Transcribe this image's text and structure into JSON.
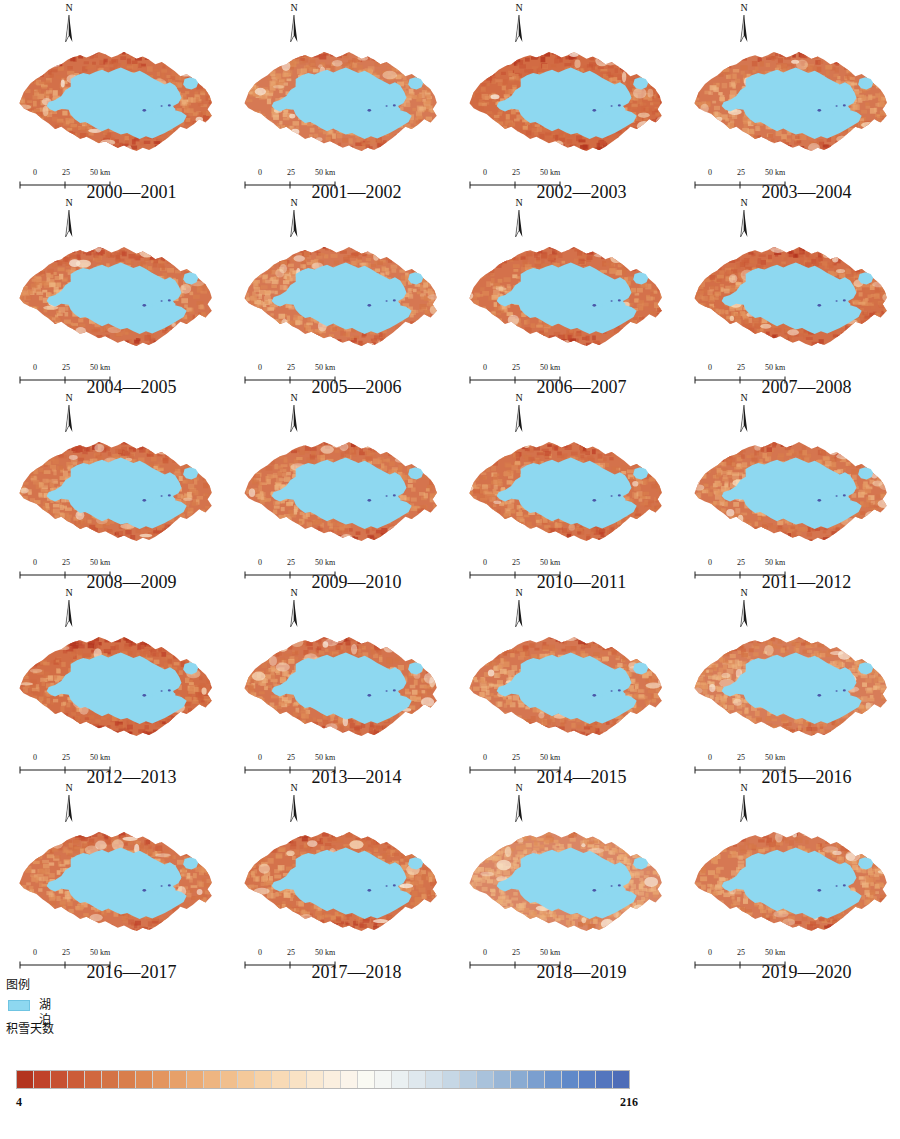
{
  "figure": {
    "type": "map-grid",
    "rows": 5,
    "columns": 4
  },
  "panels": [
    {
      "year_label": "2000—2001",
      "north_letter": "N",
      "scale": {
        "t0": "0",
        "t1": "25",
        "t2": "50 km"
      },
      "tone": 0.0
    },
    {
      "year_label": "2001—2002",
      "north_letter": "N",
      "scale": {
        "t0": "0",
        "t1": "25",
        "t2": "50 km"
      },
      "tone": 0.12
    },
    {
      "year_label": "2002—2003",
      "north_letter": "N",
      "scale": {
        "t0": "0",
        "t1": "25",
        "t2": "50 km"
      },
      "tone": -0.06
    },
    {
      "year_label": "2003—2004",
      "north_letter": "N",
      "scale": {
        "t0": "0",
        "t1": "25",
        "t2": "50 km"
      },
      "tone": 0.08
    },
    {
      "year_label": "2004—2005",
      "north_letter": "N",
      "scale": {
        "t0": "0",
        "t1": "25",
        "t2": "50 km"
      },
      "tone": 0.05
    },
    {
      "year_label": "2005—2006",
      "north_letter": "N",
      "scale": {
        "t0": "0",
        "t1": "25",
        "t2": "50 km"
      },
      "tone": 0.1
    },
    {
      "year_label": "2006—2007",
      "north_letter": "N",
      "scale": {
        "t0": "0",
        "t1": "25",
        "t2": "50 km"
      },
      "tone": 0.02
    },
    {
      "year_label": "2007—2008",
      "north_letter": "N",
      "scale": {
        "t0": "0",
        "t1": "25",
        "t2": "50 km"
      },
      "tone": -0.02
    },
    {
      "year_label": "2008—2009",
      "north_letter": "N",
      "scale": {
        "t0": "0",
        "t1": "25",
        "t2": "50 km"
      },
      "tone": 0.04
    },
    {
      "year_label": "2009—2010",
      "north_letter": "N",
      "scale": {
        "t0": "0",
        "t1": "25",
        "t2": "50 km"
      },
      "tone": 0.06
    },
    {
      "year_label": "2010—2011",
      "north_letter": "N",
      "scale": {
        "t0": "0",
        "t1": "25",
        "t2": "50 km"
      },
      "tone": 0.03
    },
    {
      "year_label": "2011—2012",
      "north_letter": "N",
      "scale": {
        "t0": "0",
        "t1": "25",
        "t2": "50 km"
      },
      "tone": 0.07
    },
    {
      "year_label": "2012—2013",
      "north_letter": "N",
      "scale": {
        "t0": "0",
        "t1": "25",
        "t2": "50 km"
      },
      "tone": -0.04
    },
    {
      "year_label": "2013—2014",
      "north_letter": "N",
      "scale": {
        "t0": "0",
        "t1": "25",
        "t2": "50 km"
      },
      "tone": 0.05
    },
    {
      "year_label": "2014—2015",
      "north_letter": "N",
      "scale": {
        "t0": "0",
        "t1": "25",
        "t2": "50 km"
      },
      "tone": 0.09
    },
    {
      "year_label": "2015—2016",
      "north_letter": "N",
      "scale": {
        "t0": "0",
        "t1": "25",
        "t2": "50 km"
      },
      "tone": 0.16
    },
    {
      "year_label": "2016—2017",
      "north_letter": "N",
      "scale": {
        "t0": "0",
        "t1": "25",
        "t2": "50 km"
      },
      "tone": 0.06
    },
    {
      "year_label": "2017—2018",
      "north_letter": "N",
      "scale": {
        "t0": "0",
        "t1": "25",
        "t2": "50 km"
      },
      "tone": 0.03
    },
    {
      "year_label": "2018—2019",
      "north_letter": "N",
      "scale": {
        "t0": "0",
        "t1": "25",
        "t2": "50 km"
      },
      "tone": 0.3
    },
    {
      "year_label": "2019—2020",
      "north_letter": "N",
      "scale": {
        "t0": "0",
        "t1": "25",
        "t2": "50 km"
      },
      "tone": 0.11
    }
  ],
  "legend": {
    "title": "图例",
    "lake_label": "湖泊",
    "lake_color": "#8ed8f0",
    "snow_title": "积雪天数",
    "colorbar_min": "4",
    "colorbar_max": "216",
    "colorbar_colors": [
      "#b3341f",
      "#c0422a",
      "#c75132",
      "#cc5c38",
      "#d1683f",
      "#d47345",
      "#d97e4c",
      "#de8a55",
      "#e3955f",
      "#e7a069",
      "#ebab75",
      "#eeb581",
      "#f1bf8d",
      "#f4c99a",
      "#f6d2a8",
      "#f8dab6",
      "#f9e2c4",
      "#fae9d2",
      "#fbefdf",
      "#fbf4ea",
      "#fafaf3",
      "#f4f6f4",
      "#eaf0f2",
      "#dfe8ee",
      "#d3e0ea",
      "#c6d7e5",
      "#b8cde0",
      "#a9c2db",
      "#99b6d6",
      "#8aabd2",
      "#7b9fcf",
      "#6d94cc",
      "#6089c9",
      "#5a7fc4",
      "#5476be",
      "#4e6db8"
    ]
  },
  "chart_data": {
    "type": "heatmap",
    "title": "积雪天数",
    "colorbar_label": "积雪天数",
    "vmin": 4,
    "vmax": 216,
    "colormap": "RdYlBu",
    "n_bins": 36,
    "categories": [
      "2000—2001",
      "2001—2002",
      "2002—2003",
      "2003—2004",
      "2004—2005",
      "2005—2006",
      "2006—2007",
      "2007—2008",
      "2008—2009",
      "2009—2010",
      "2010—2011",
      "2011—2012",
      "2012—2013",
      "2013—2014",
      "2014—2015",
      "2015—2016",
      "2016—2017",
      "2017—2018",
      "2018—2019",
      "2019—2020"
    ],
    "xlabel": "",
    "ylabel": "",
    "legend_position": "bottom",
    "grid": false
  }
}
